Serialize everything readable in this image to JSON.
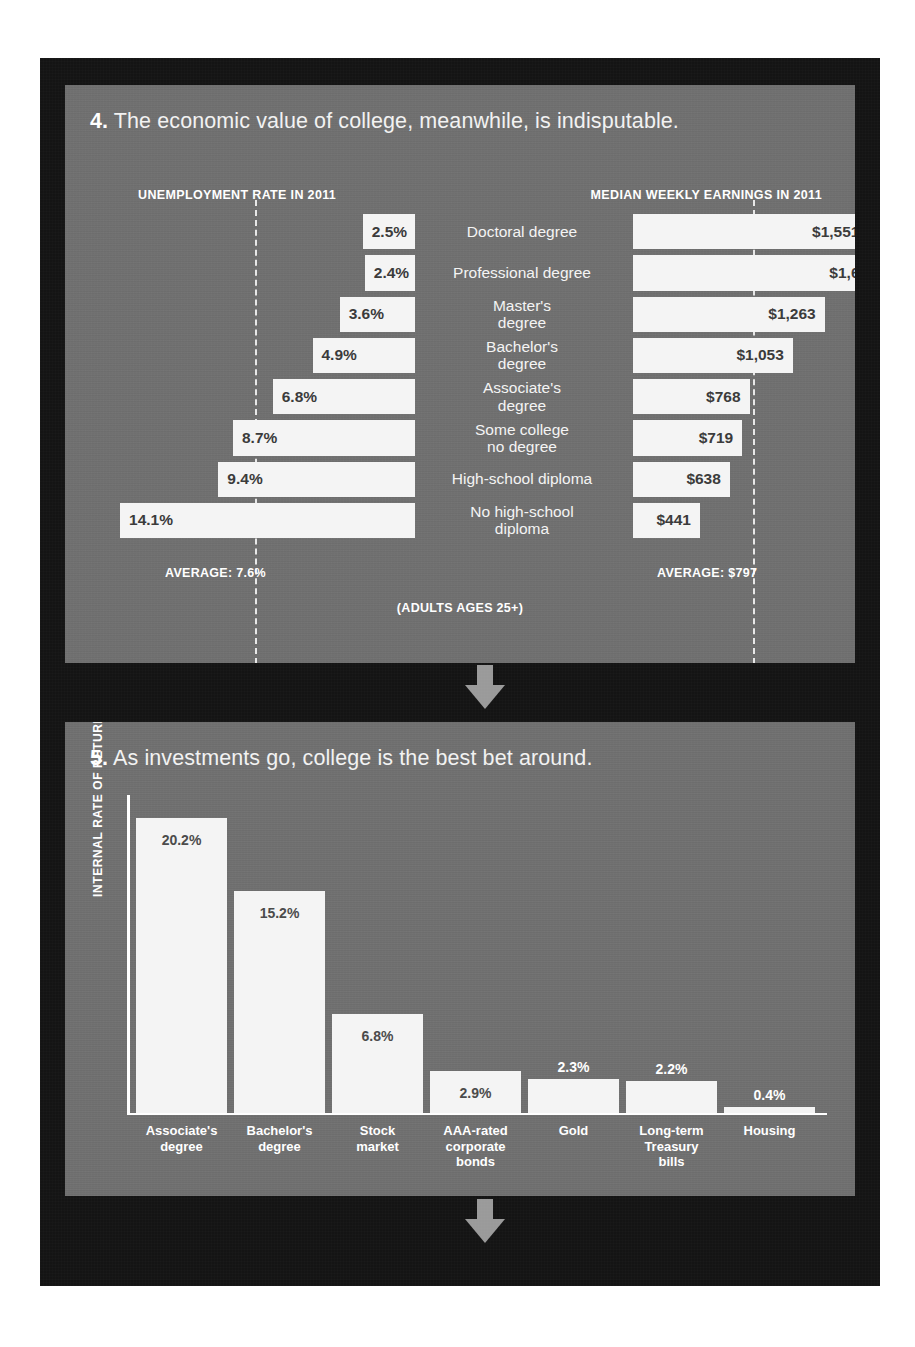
{
  "poster": {
    "background_color": "#141414",
    "panel_color": "#6e6e6e",
    "bar_color": "#f4f4f4",
    "arrow_color": "#9a9a9a"
  },
  "panel4": {
    "number": "4.",
    "title": "The economic value of college, meanwhile, is indisputable.",
    "left_header": "UNEMPLOYMENT RATE IN 2011",
    "right_header": "MEDIAN WEEKLY EARNINGS IN 2011",
    "left_average_label": "AVERAGE: 7.6%",
    "right_average_label": "AVERAGE: $797",
    "footnote": "(ADULTS AGES 25+)"
  },
  "panel5": {
    "number": "5.",
    "title": "As investments go, college is the best bet around.",
    "ylabel": "INTERNAL RATE OF RETURN"
  },
  "arrows": {
    "arrow1": "down-arrow",
    "arrow2": "down-arrow"
  },
  "chart_data": [
    {
      "type": "bar",
      "orientation": "horizontal-diverging",
      "title": "The economic value of college, meanwhile, is indisputable.",
      "subtitle": "(ADULTS AGES 25+)",
      "categories": [
        "Doctoral degree",
        "Professional degree",
        "Master's degree",
        "Bachelor's degree",
        "Associate's degree",
        "Some college no degree",
        "High-school diploma",
        "No high-school diploma"
      ],
      "series": [
        {
          "name": "UNEMPLOYMENT RATE IN 2011",
          "side": "left",
          "unit": "%",
          "values": [
            2.5,
            2.4,
            3.6,
            4.9,
            6.8,
            8.7,
            9.4,
            14.1
          ],
          "labels": [
            "2.5%",
            "2.4%",
            "3.6%",
            "4.9%",
            "6.8%",
            "8.7%",
            "9.4%",
            "14.1%"
          ],
          "average": 7.6,
          "average_label": "AVERAGE: 7.6%"
        },
        {
          "name": "MEDIAN WEEKLY EARNINGS IN 2011",
          "side": "right",
          "unit": "$",
          "values": [
            1551,
            1665,
            1263,
            1053,
            768,
            719,
            638,
            441
          ],
          "labels": [
            "$1,551",
            "$1,665",
            "$1,263",
            "$1,053",
            "$768",
            "$719",
            "$638",
            "$441"
          ],
          "average": 797,
          "average_label": "AVERAGE: $797"
        }
      ],
      "grid": false,
      "legend": "none"
    },
    {
      "type": "bar",
      "orientation": "vertical",
      "title": "As investments go, college is the best bet around.",
      "xlabel": "",
      "ylabel": "INTERNAL RATE OF RETURN",
      "ylim": [
        0,
        22
      ],
      "categories": [
        "Associate's degree",
        "Bachelor's degree",
        "Stock market",
        "AAA-rated corporate bonds",
        "Gold",
        "Long-term Treasury bills",
        "Housing"
      ],
      "category_lines": [
        [
          "Associate's",
          "degree"
        ],
        [
          "Bachelor's",
          "degree"
        ],
        [
          "Stock",
          "market"
        ],
        [
          "AAA-rated",
          "corporate",
          "bonds"
        ],
        [
          "Gold"
        ],
        [
          "Long-term",
          "Treasury",
          "bills"
        ],
        [
          "Housing"
        ]
      ],
      "values": [
        20.2,
        15.2,
        6.8,
        2.9,
        2.3,
        2.2,
        0.4
      ],
      "labels": [
        "20.2%",
        "15.2%",
        "6.8%",
        "2.9%",
        "2.3%",
        "2.2%",
        "0.4%"
      ],
      "grid": false,
      "legend": "none"
    }
  ]
}
